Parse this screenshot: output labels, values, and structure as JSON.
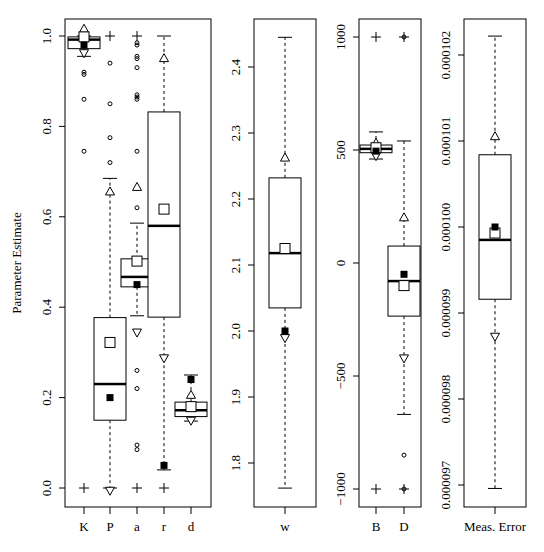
{
  "chart_data": [
    {
      "type": "box",
      "panel": "parameters-0-1",
      "ylabel": "Parameter Estimate",
      "ylim": [
        -0.035,
        1.035
      ],
      "yticks": [
        "0.0",
        "0.2",
        "0.4",
        "0.6",
        "0.8",
        "1.0"
      ],
      "categories": [
        "K",
        "P",
        "a",
        "r",
        "d"
      ],
      "boxes": [
        {
          "label": "K",
          "q1": 0.972,
          "median": 0.992,
          "q3": 0.998,
          "whisker_low": 0.955,
          "whisker_high": 1.0,
          "mean_open": 0.998,
          "mean_filled": 0.98,
          "tri_up": 1.015,
          "tri_down": 0.963,
          "plus": [
            0.0
          ],
          "outliers": [
            0.92,
            0.915,
            0.86,
            0.745
          ]
        },
        {
          "label": "P",
          "q1": 0.15,
          "median": 0.23,
          "q3": 0.377,
          "whisker_low": 0.0,
          "whisker_high": 0.685,
          "mean_open": 0.322,
          "mean_filled": 0.2,
          "tri_up": 0.655,
          "tri_down": -0.005,
          "plus": [
            1.0
          ],
          "outliers": [
            0.94,
            0.85,
            0.775,
            0.72
          ]
        },
        {
          "label": "a",
          "q1": 0.445,
          "median": 0.467,
          "q3": 0.507,
          "whisker_low": 0.381,
          "whisker_high": 0.586,
          "mean_open": 0.502,
          "mean_filled": 0.45,
          "tri_up": 0.665,
          "tri_down": 0.345,
          "plus": [
            1.0,
            0.0
          ],
          "outliers": [
            0.985,
            0.98,
            0.955,
            0.95,
            0.93,
            0.87,
            0.865,
            0.86,
            0.745,
            0.62,
            0.26,
            0.22,
            0.095,
            0.085
          ]
        },
        {
          "label": "r",
          "q1": 0.378,
          "median": 0.58,
          "q3": 0.832,
          "whisker_low": 0.04,
          "whisker_high": 1.0,
          "mean_open": 0.617,
          "mean_filled": 0.05,
          "tri_up": 0.95,
          "tri_down": 0.288,
          "plus": [
            0.0
          ],
          "outliers": []
        },
        {
          "label": "d",
          "q1": 0.158,
          "median": 0.172,
          "q3": 0.19,
          "whisker_low": 0.148,
          "whisker_high": 0.25,
          "mean_open": 0.18,
          "mean_filled": 0.24,
          "tri_up": 0.205,
          "tri_down": 0.15,
          "plus": [],
          "outliers": []
        }
      ]
    },
    {
      "type": "box",
      "panel": "w",
      "ylim": [
        1.74,
        2.47
      ],
      "yticks": [
        "1.8",
        "1.9",
        "2.0",
        "2.1",
        "2.2",
        "2.3",
        "2.4"
      ],
      "categories": [
        "w"
      ],
      "boxes": [
        {
          "label": "w",
          "q1": 2.035,
          "median": 2.118,
          "q3": 2.232,
          "whisker_low": 1.762,
          "whisker_high": 2.445,
          "mean_open": 2.125,
          "mean_filled": 2.0,
          "tri_up": 2.262,
          "tri_down": 1.99,
          "plus": [],
          "outliers": []
        }
      ]
    },
    {
      "type": "box",
      "panel": "B-D",
      "ylim": [
        -1080,
        1080
      ],
      "yticks": [
        "-1000",
        "-500",
        "0",
        "500",
        "1000"
      ],
      "categories": [
        "B",
        "D"
      ],
      "boxes": [
        {
          "label": "B",
          "q1": 488,
          "median": 505,
          "q3": 522,
          "whisker_low": 460,
          "whisker_high": 580,
          "mean_open": 510,
          "mean_filled": 495,
          "tri_up": 530,
          "tri_down": 475,
          "plus": [
            1000,
            -1000
          ],
          "outliers": []
        },
        {
          "label": "D",
          "q1": -235,
          "median": -80,
          "q3": 75,
          "whisker_low": -670,
          "whisker_high": 540,
          "mean_open": -100,
          "mean_filled": -50,
          "tri_up": 200,
          "tri_down": -420,
          "plus": [
            1000,
            -1000
          ],
          "outliers": [
            -850,
            1000,
            -1000
          ]
        }
      ]
    },
    {
      "type": "box",
      "panel": "meas-error",
      "ylim": [
        9.68e-05,
        0.00010225
      ],
      "yticks": [
        "0.000097",
        "0.000098",
        "0.000099",
        "0.000100",
        "0.000101",
        "0.000102"
      ],
      "categories": [
        "Meas. Error"
      ],
      "boxes": [
        {
          "label": "Meas. Error",
          "q1": 9.916e-05,
          "median": 9.985e-05,
          "q3": 0.00010084,
          "whisker_low": 9.696e-05,
          "whisker_high": 0.00010222,
          "mean_open": 9.993e-05,
          "mean_filled": 0.0001,
          "tri_up": 0.00010105,
          "tri_down": 9.873e-05,
          "plus": [],
          "outliers": []
        }
      ]
    }
  ],
  "panels": [
    {
      "frame": {
        "x": 65,
        "y": 19,
        "w": 146,
        "h": 488
      },
      "y_top_val": 1.0,
      "y_top_px": 36,
      "y_bot_val": 0.0,
      "y_bot_px": 488,
      "xs": [
        84,
        110,
        137,
        164,
        191
      ],
      "tick_labels_x": 40,
      "tick_fmt": 1
    },
    {
      "frame": {
        "x": 254,
        "y": 19,
        "w": 62,
        "h": 488
      },
      "y_top_val": 2.4,
      "y_top_px": 67,
      "y_bot_val": 1.8,
      "y_bot_px": 463,
      "xs": [
        285
      ],
      "tick_labels_x": 235,
      "tick_fmt": 1
    },
    {
      "frame": {
        "x": 359,
        "y": 19,
        "w": 62,
        "h": 488
      },
      "y_top_val": 1000,
      "y_top_px": 37,
      "y_bot_val": -1000,
      "y_bot_px": 489,
      "xs": [
        376,
        404
      ],
      "tick_labels_x": 340,
      "tick_fmt": 0
    },
    {
      "frame": {
        "x": 464,
        "y": 19,
        "w": 62,
        "h": 488
      },
      "y_top_val": 0.000102,
      "y_top_px": 55,
      "y_bot_val": 9.7e-05,
      "y_bot_px": 485,
      "xs": [
        495
      ],
      "tick_labels_x": 444,
      "tick_fmt": 6
    }
  ],
  "ylabel": "Parameter Estimate",
  "caption": "Fig. 5  Parameter estimates for the fitted model (see text)"
}
